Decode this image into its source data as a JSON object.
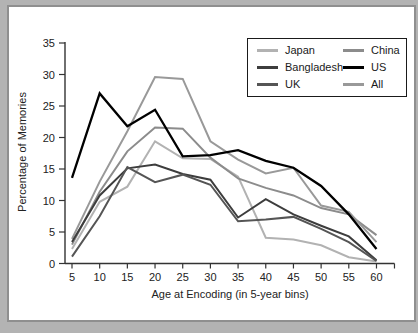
{
  "figure": {
    "x_axis_title": "Age at Encoding (in 5-year bins)",
    "y_axis_title": "Percentage of Memories"
  },
  "legend": {
    "items": [
      {
        "label": "Japan",
        "color": "#b2b2b2"
      },
      {
        "label": "Bangladesh",
        "color": "#3d3d3d"
      },
      {
        "label": "UK",
        "color": "#555555"
      },
      {
        "label": "China",
        "color": "#8c8c8c"
      },
      {
        "label": "US",
        "color": "#000000"
      },
      {
        "label": "All",
        "color": "#999999"
      }
    ]
  },
  "chart_data": {
    "type": "line",
    "title": "",
    "xlabel": "Age at Encoding (in 5-year bins)",
    "ylabel": "Percentage of Memories",
    "x": [
      5,
      10,
      15,
      20,
      25,
      30,
      35,
      40,
      45,
      50,
      55,
      60
    ],
    "x_tick_labels": [
      "5",
      "10",
      "15",
      "20",
      "25",
      "30",
      "35",
      "40",
      "45",
      "50",
      "55",
      "60"
    ],
    "y_ticks": [
      0,
      5,
      10,
      15,
      20,
      25,
      30,
      35
    ],
    "ylim": [
      0,
      35
    ],
    "xlim": [
      5,
      60
    ],
    "grid": false,
    "legend_position": "top-right",
    "legend_columns": [
      [
        "Japan",
        "Bangladesh",
        "UK"
      ],
      [
        "China",
        "US",
        "All"
      ]
    ],
    "series": [
      {
        "name": "Japan",
        "color": "#b2b2b2",
        "width": 2,
        "values": [
          2.3,
          9.8,
          12.2,
          19.4,
          16.7,
          16.6,
          13.8,
          4.1,
          3.8,
          2.9,
          1.0,
          0.3
        ]
      },
      {
        "name": "China",
        "color": "#8c8c8c",
        "width": 2,
        "values": [
          3.0,
          11.4,
          17.8,
          21.6,
          21.4,
          16.8,
          13.5,
          12.0,
          10.8,
          8.8,
          7.8,
          4.5
        ]
      },
      {
        "name": "All",
        "color": "#999999",
        "width": 2,
        "values": [
          3.9,
          13.0,
          21.0,
          29.6,
          29.3,
          19.4,
          16.5,
          14.3,
          15.2,
          9.2,
          8.2,
          3.4
        ]
      },
      {
        "name": "Bangladesh",
        "color": "#3d3d3d",
        "width": 2,
        "values": [
          3.4,
          10.8,
          15.1,
          15.7,
          14.2,
          13.3,
          7.3,
          10.2,
          7.8,
          6.0,
          4.3,
          0.5
        ]
      },
      {
        "name": "UK",
        "color": "#555555",
        "width": 2,
        "values": [
          1.1,
          7.5,
          15.3,
          12.9,
          14.1,
          12.5,
          6.7,
          7.0,
          7.4,
          5.5,
          3.4,
          0.4
        ]
      },
      {
        "name": "US",
        "color": "#000000",
        "width": 2.3,
        "values": [
          13.6,
          27.0,
          21.8,
          24.4,
          17.0,
          17.2,
          18.0,
          16.3,
          15.2,
          12.3,
          7.8,
          2.3
        ]
      }
    ]
  }
}
